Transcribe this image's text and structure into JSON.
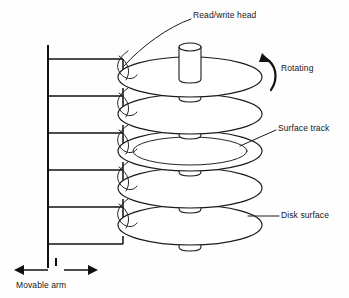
{
  "diagram": {
    "background_color": "#fefefe",
    "line_color": "#1a1a1a"
  },
  "labels": {
    "read_write_head": "Read/write head",
    "rotating": "Rotating",
    "surface_track": "Surface track",
    "disk_surface": "Disk surface",
    "movable_arm": "Movable arm"
  },
  "components": {
    "platters": {
      "count": 5,
      "center_x": 190,
      "radius_x": 72,
      "radius_y": 20,
      "centers_y": [
        77,
        114,
        151,
        188,
        225
      ],
      "track_platter_index": 2,
      "track_radius_x": 57,
      "track_radius_y": 14
    },
    "spindle": {
      "count": 6,
      "center_x": 190,
      "half_width": 11,
      "cap_radius_y": 4,
      "height": 23,
      "top_cap_y": 47
    },
    "access_arm": {
      "post_x": 48,
      "post_top_y": 45,
      "post_bottom_y": 268,
      "arm_tip_x": 123,
      "arm_count": 6,
      "arm_y": [
        59,
        96,
        133,
        170,
        207,
        244
      ]
    },
    "heads": {
      "count": 5,
      "attach_x": 123
    },
    "rotation_arrow": {
      "direction": "counterclockwise-top",
      "anchor_x": 270,
      "anchor_y": 72
    },
    "movable_arm_arrow": {
      "direction": "bidirectional-horizontal",
      "y": 270,
      "left_x": 14,
      "right_x": 98,
      "tick_x": 56
    }
  },
  "leader_lines": {
    "read_write_head": {
      "from": [
        191,
        19
      ],
      "to": [
        124,
        66
      ]
    },
    "surface_track": {
      "from": [
        276,
        130
      ],
      "to": [
        240,
        146
      ]
    },
    "disk_surface": {
      "from": [
        279,
        216
      ],
      "to": [
        248,
        216
      ]
    }
  }
}
